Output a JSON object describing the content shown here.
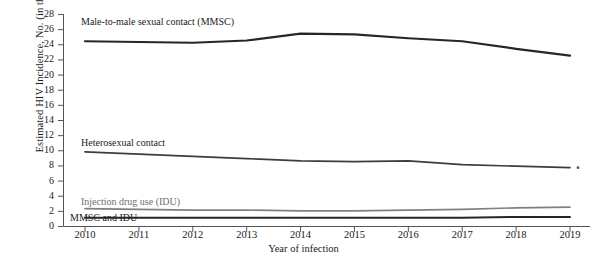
{
  "chart_data": {
    "type": "line",
    "title": "",
    "xlabel": "Year of infection",
    "ylabel": "Estimated HIV Incidence, No. (in thousands)",
    "x": [
      2010,
      2011,
      2012,
      2013,
      2014,
      2015,
      2016,
      2017,
      2018,
      2019
    ],
    "xtick_labels": [
      "2010",
      "2011",
      "2012",
      "2013",
      "2014",
      "2015",
      "2016",
      "2017",
      "2018",
      "2019"
    ],
    "ytick_labels": [
      "0",
      "2",
      "4",
      "6",
      "8",
      "10",
      "12",
      "14",
      "16",
      "18",
      "20",
      "22",
      "24",
      "26",
      "28"
    ],
    "yticks": [
      0,
      2,
      4,
      6,
      8,
      10,
      12,
      14,
      16,
      18,
      20,
      22,
      24,
      26,
      28
    ],
    "ylim": [
      0,
      28
    ],
    "xlim": [
      2010,
      2019
    ],
    "grid": false,
    "legend_position": "inline-labels",
    "series": [
      {
        "name": "Male-to-male sexual contact (MMSC)",
        "label": "Male-to-male sexual contact (MMSC)",
        "color": "#262626",
        "width": 2.2,
        "values": [
          24.4,
          24.3,
          24.2,
          24.5,
          25.4,
          25.3,
          24.8,
          24.4,
          23.4,
          22.5
        ]
      },
      {
        "name": "Heterosexual contact",
        "label": "Heterosexual contact",
        "color": "#3d3d3d",
        "width": 1.7,
        "values": [
          9.8,
          9.5,
          9.2,
          8.9,
          8.6,
          8.5,
          8.6,
          8.1,
          7.9,
          7.7
        ]
      },
      {
        "name": "Injection drug use (IDU)",
        "label": "Injection drug use (IDU)",
        "color": "#808080",
        "width": 1.7,
        "values": [
          2.3,
          2.2,
          2.1,
          2.1,
          2.0,
          2.0,
          2.1,
          2.2,
          2.4,
          2.5
        ]
      },
      {
        "name": "MMSC and IDU",
        "label": "MMSC and IDU",
        "color": "#262626",
        "width": 2.0,
        "values": [
          1.1,
          1.1,
          1.1,
          1.1,
          1.1,
          1.1,
          1.1,
          1.1,
          1.2,
          1.2
        ]
      }
    ],
    "annotations": [
      {
        "name": "right-end-marker",
        "x": 2019,
        "y": 7.7
      }
    ]
  },
  "axis": {
    "y_title": "Estimated HIV Incidence, No. (in thousands)",
    "x_title": "Year of infection"
  }
}
